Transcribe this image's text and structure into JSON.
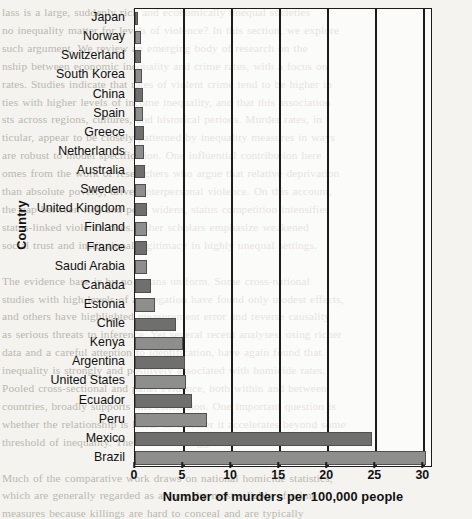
{
  "background_text": "lass is a large, suddenly rich and economically unequal societies\nno inequality matter for levels of violence? In this section, we explore\nsuch argument. We review an emerging body of research on the\nnship between economic inequality and crime rates, with a focus on\nrates. Studies indicate that rates of violent crime tend to be higher in\nties with higher levels of income inequality, and that this association\nsts across regions, cultures, and historical periods. Murder rates, in\nticular, appear to be closely patterned by inequality measures in ways\nare robust to model specification. One influential contribution here\nomes from the work of researchers who argue that relative deprivation\nthan absolute poverty, drives interpersonal violence. On this account,\nthe gap between rich and poor widens, status competition intensifies\nstatus-linked violence rises. Other scholars emphasize weakened\nsocial trust and institutional legitimacy in highly unequal settings.\n\nThe evidence base is by no means uniform. Some cross-national\nstudies with high levels of aggregation have found only modest effects,\nand others have highlighted measurement error and reverse causality\nas serious threats to inference. Yet several recent analyses, using richer\ndata and a careful attention to identification, have again found that\ninequality is strongly and positively associated with homicide rates.\nPooled cross-sectional and panel evidence, both within and between\ncountries, broadly supports this conclusion. One important question is\nwhether the relationship is linear or whether it accelerates beyond some\nthreshold of inequality. There is some suggestive evidence for the latter.\n\nMuch of the comparative work draws on national homicide statistics,\nwhich are generally regarded as among the most reliable of crime\nmeasures because killings are hard to conceal and are typically\nrecorded by several independent agencies. Even so, definitional\ndifferences across countries complicate direct comparison, and some\nstates are known to undercount politically sensitive deaths.\n\nThe figure below presents national murder rates for a selection of\ncountries. The contrast between the most equal societies and the most\nunequal is striking.\n\nNote especially how the Latin American countries at the bottom of the\nchart differ from the Nordic and East Asian cases at the top. Such\ncomparisons are not, of course, conclusive on their own, and many\nother factors, including the scale of organized crime and the drug trade,\nplainly contribute to these large differences between societies.\n\nIn the chapter that follows we consider the policy implications of this\nevidence, and ask whether reducing inequality could reasonably be\nexpected to reduce rates of lethal violence over time.\n\nSee also the discussion of trust and social capital in chapter four,\nwhere many of the same underlying mechanisms are explored.",
  "chart_data": {
    "type": "bar",
    "orientation": "horizontal",
    "title": "",
    "xlabel": "Number of murders per 100,000 people",
    "ylabel": "Country",
    "xlim": [
      0,
      31
    ],
    "xticks": [
      0,
      5,
      10,
      15,
      20,
      25,
      30
    ],
    "grid": "vertical",
    "legend": "none",
    "categories": [
      "Japan",
      "Norway",
      "Switzerland",
      "South Korea",
      "China",
      "Spain",
      "Greece",
      "Netherlands",
      "Australia",
      "Sweden",
      "United Kingdom",
      "Finland",
      "France",
      "Saudi Arabia",
      "Canada",
      "Estonia",
      "Chile",
      "Kenya",
      "Argentina",
      "United States",
      "Ecuador",
      "Peru",
      "Mexico",
      "Brazil"
    ],
    "values": [
      0.3,
      0.6,
      0.6,
      0.7,
      0.8,
      0.8,
      0.9,
      0.9,
      1.0,
      1.1,
      1.2,
      1.3,
      1.3,
      1.3,
      1.7,
      2.1,
      4.3,
      5.0,
      5.2,
      5.3,
      5.9,
      7.5,
      24.7,
      30.3
    ],
    "bar_colors": [
      "#6f6f6e",
      "#8e8e8d"
    ],
    "bar_edge_color": "#50504f",
    "axis_color": "#1c1c1c"
  }
}
